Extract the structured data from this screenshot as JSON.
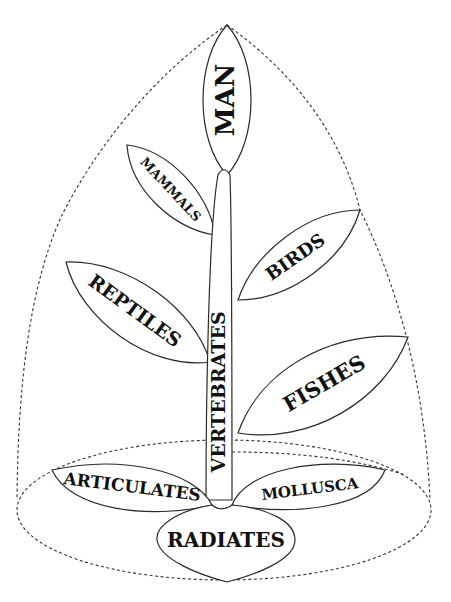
{
  "diagram": {
    "type": "tree-of-life",
    "root": "Radiates",
    "labels": {
      "man": "MAN",
      "mammals": "MAMMALS",
      "birds": "BIRDS",
      "reptiles": "REPTILES",
      "fishes": "FISHES",
      "vertebrates": "VERTEBRATES",
      "articulates": "ARTICULATES",
      "mollusca": "MOLLUSCA",
      "radiates": "RADIATES"
    },
    "structure": {
      "stem": "VERTEBRATES",
      "branches_from_stem": [
        "MAN",
        "MAMMALS",
        "BIRDS",
        "REPTILES",
        "FISHES"
      ],
      "base_branches": [
        "ARTICULATES",
        "MOLLUSCA",
        "RADIATES"
      ]
    },
    "colors": {
      "ink": "#111111",
      "background": "#ffffff"
    }
  }
}
